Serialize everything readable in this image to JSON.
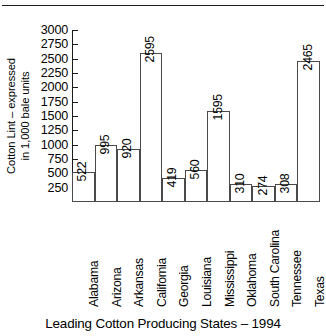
{
  "chart_data": {
    "type": "bar",
    "title": "",
    "caption": "Leading Cotton Producing States – 1994",
    "xlabel": "",
    "ylabel_line1": "Cotton Lint – expressed",
    "ylabel_line2": "in 1,000 bale units",
    "ylim": [
      0,
      3000
    ],
    "ytick_step": 250,
    "yticks": [
      250,
      500,
      750,
      1000,
      1250,
      1500,
      1750,
      2000,
      2250,
      2500,
      2750,
      3000
    ],
    "ytick_labels": [
      "250",
      "500",
      "750",
      "1000",
      "1250",
      "1500",
      "1750",
      "2000",
      "2250",
      "2500",
      "2750",
      "3000"
    ],
    "grid": false,
    "legend": "none",
    "bar_style": {
      "fill": "#ffffff",
      "border": "#4a4a4a",
      "gap": 0
    },
    "categories": [
      "Alabama",
      "Arizona",
      "Arkansas",
      "California",
      "Georgia",
      "Louisiana",
      "Mississippi",
      "Oklahoma",
      "South Carolina",
      "Tennessee",
      "Texas"
    ],
    "values": [
      522,
      995,
      920,
      2595,
      419,
      560,
      1595,
      310,
      274,
      308,
      2465
    ],
    "value_labels": [
      "522",
      "995",
      "920",
      "2595",
      "419",
      "560",
      "1595",
      "310",
      "274",
      "308",
      "2465"
    ],
    "points": [
      {
        "state": "Alabama",
        "value": 522,
        "label": "522"
      },
      {
        "state": "Arizona",
        "value": 995,
        "label": "995"
      },
      {
        "state": "Arkansas",
        "value": 920,
        "label": "920"
      },
      {
        "state": "California",
        "value": 2595,
        "label": "2595"
      },
      {
        "state": "Georgia",
        "value": 419,
        "label": "419"
      },
      {
        "state": "Louisiana",
        "value": 560,
        "label": "560"
      },
      {
        "state": "Mississippi",
        "value": 1595,
        "label": "1595"
      },
      {
        "state": "Oklahoma",
        "value": 310,
        "label": "310"
      },
      {
        "state": "South Carolina",
        "value": 274,
        "label": "274"
      },
      {
        "state": "Tennessee",
        "value": 308,
        "label": "308"
      },
      {
        "state": "Texas",
        "value": 2465,
        "label": "2465"
      }
    ],
    "colors": {
      "axis": "#1b1b1b",
      "bar_fill": "#ffffff",
      "bar_border": "#4a4a4a",
      "text": "#000000",
      "background": "#ffffff"
    }
  }
}
